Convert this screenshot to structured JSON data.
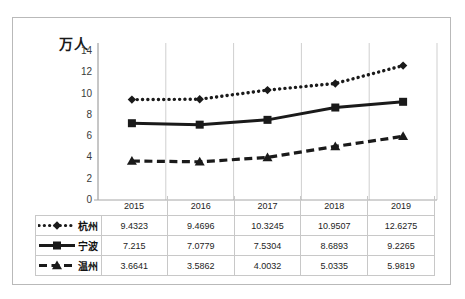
{
  "axis_unit_label": "万人",
  "colors": {
    "series_line": "#1a1a1a",
    "gridline": "#cfcfcf",
    "axis": "#a6a6a6",
    "table_border": "#c8c8c8",
    "frame_border": "#b9b9b9"
  },
  "table": {
    "corner_blank": "",
    "year_headers": [
      "2015",
      "2016",
      "2017",
      "2018",
      "2019"
    ],
    "rows": [
      {
        "legend_label": "杭州",
        "legend_style": "dotted-diamond",
        "values": [
          "9.4323",
          "9.4696",
          "10.3245",
          "10.9507",
          "12.6275"
        ]
      },
      {
        "legend_label": "宁波",
        "legend_style": "solid-square",
        "values": [
          "7.215",
          "7.0779",
          "7.5304",
          "8.6893",
          "9.2265"
        ]
      },
      {
        "legend_label": "温州",
        "legend_style": "dashed-triangle",
        "values": [
          "3.6641",
          "3.5862",
          "4.0032",
          "5.0335",
          "5.9819"
        ]
      }
    ]
  },
  "chart_data": {
    "type": "line",
    "title": "",
    "subtitle": "",
    "xlabel": "",
    "ylabel": "万人",
    "categories": [
      "2015",
      "2016",
      "2017",
      "2018",
      "2019"
    ],
    "ylim": [
      0,
      14
    ],
    "yticks": [
      0,
      2,
      4,
      6,
      8,
      10,
      12,
      14
    ],
    "ytick_labels": [
      "0",
      "2",
      "4",
      "6",
      "8",
      "10",
      "12",
      "14"
    ],
    "grid": {
      "vertical": true,
      "horizontal": false
    },
    "legend_position": "bottom-table",
    "series": [
      {
        "name": "杭州",
        "marker": "diamond",
        "linestyle": "dotted",
        "values": [
          9.4323,
          9.4696,
          10.3245,
          10.9507,
          12.6275
        ]
      },
      {
        "name": "宁波",
        "marker": "square",
        "linestyle": "solid",
        "values": [
          7.215,
          7.0779,
          7.5304,
          8.6893,
          9.2265
        ]
      },
      {
        "name": "温州",
        "marker": "triangle",
        "linestyle": "dashed",
        "values": [
          3.6641,
          3.5862,
          4.0032,
          5.0335,
          5.9819
        ]
      }
    ]
  }
}
